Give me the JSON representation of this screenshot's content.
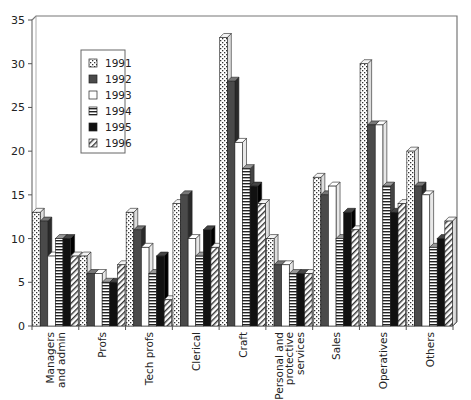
{
  "chart_data": {
    "type": "bar",
    "title": "",
    "xlabel": "",
    "ylabel": "",
    "ylim": [
      0,
      35
    ],
    "yticks": [
      0,
      5,
      10,
      15,
      20,
      25,
      30,
      35
    ],
    "grid": false,
    "legend_position": "upper-left-inside",
    "style": "3d-clustered",
    "categories": [
      "Managers and admin",
      "Profs",
      "Tech profs",
      "Clerical",
      "Craft",
      "Personal and protective services",
      "Sales",
      "Operatives",
      "Others"
    ],
    "category_label_lines": [
      [
        "Managers",
        "and admin"
      ],
      [
        "Profs"
      ],
      [
        "Tech profs"
      ],
      [
        "Clerical"
      ],
      [
        "Craft"
      ],
      [
        "Personal and",
        "protective",
        "services"
      ],
      [
        "Sales"
      ],
      [
        "Operatives"
      ],
      [
        "Others"
      ]
    ],
    "series": [
      {
        "name": "1991",
        "pattern": "dotted-diagonal",
        "values": [
          13,
          8,
          13,
          14,
          33,
          10,
          17,
          30,
          20
        ]
      },
      {
        "name": "1992",
        "pattern": "dark-grey",
        "values": [
          12,
          6,
          11,
          15,
          28,
          7,
          15,
          23,
          16
        ]
      },
      {
        "name": "1993",
        "pattern": "white",
        "values": [
          8,
          6,
          9,
          10,
          21,
          7,
          16,
          23,
          15
        ]
      },
      {
        "name": "1994",
        "pattern": "horizontal-stripes",
        "values": [
          10,
          5,
          6,
          8,
          18,
          6,
          10,
          16,
          9
        ]
      },
      {
        "name": "1995",
        "pattern": "black",
        "values": [
          10,
          5,
          8,
          11,
          16,
          6,
          13,
          13,
          10
        ]
      },
      {
        "name": "1996",
        "pattern": "diagonal-hatch",
        "values": [
          8,
          7,
          3,
          9,
          14,
          6,
          11,
          14,
          12
        ]
      }
    ]
  },
  "legend": {
    "items": [
      "1991",
      "1992",
      "1993",
      "1994",
      "1995",
      "1996"
    ]
  }
}
